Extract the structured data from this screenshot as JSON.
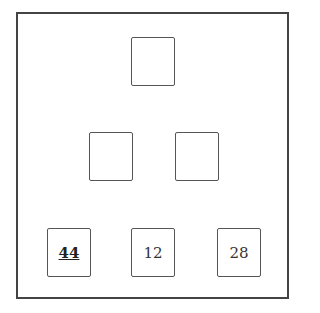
{
  "diagram": {
    "type": "number-pyramid",
    "rows": [
      {
        "row": 1,
        "cells": [
          {
            "value": "",
            "emphasis": false
          }
        ]
      },
      {
        "row": 2,
        "cells": [
          {
            "value": "",
            "emphasis": false
          },
          {
            "value": "",
            "emphasis": false
          }
        ]
      },
      {
        "row": 3,
        "cells": [
          {
            "value": "44",
            "emphasis": true
          },
          {
            "value": "12",
            "emphasis": false
          },
          {
            "value": "28",
            "emphasis": false
          }
        ]
      }
    ],
    "colors": {
      "border": "#444444",
      "text": "#333333",
      "background": "#ffffff"
    }
  }
}
